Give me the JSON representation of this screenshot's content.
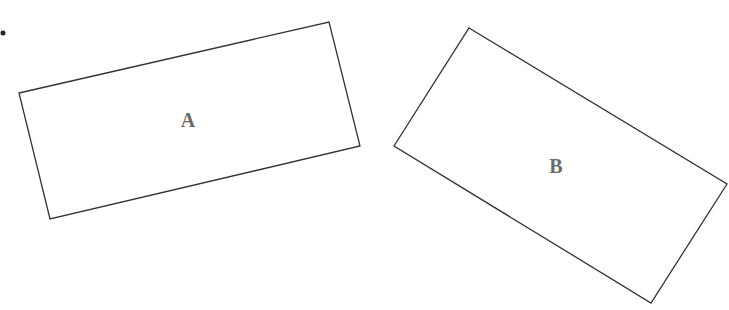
{
  "diagram": {
    "bullet": {
      "cx": 3,
      "cy": 33,
      "r": 2.5,
      "color": "#222222"
    },
    "shapes": [
      {
        "id": "A",
        "label": "A",
        "points": "19,93 329,22 360,146 50,219",
        "label_x": 188,
        "label_y": 127,
        "stroke": "#333333"
      },
      {
        "id": "B",
        "label": "B",
        "points": "469,28 727,184 651,303 394,146",
        "label_x": 556,
        "label_y": 173,
        "stroke": "#333333"
      }
    ]
  }
}
